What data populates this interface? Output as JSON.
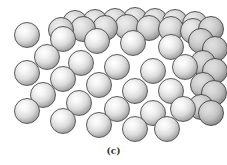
{
  "figure": {
    "caption": "(c)",
    "sphere_diameter": 26,
    "colors": {
      "highlight": "#ffffff",
      "shadow": "#4a4a4a",
      "outline": "#5a5a5a",
      "background": "#ffffff"
    },
    "spheres": [
      {
        "x": 62,
        "y": 10,
        "layer": "back"
      },
      {
        "x": 82,
        "y": 9,
        "layer": "back"
      },
      {
        "x": 102,
        "y": 8,
        "layer": "back"
      },
      {
        "x": 122,
        "y": 7,
        "layer": "back"
      },
      {
        "x": 142,
        "y": 8,
        "layer": "back"
      },
      {
        "x": 162,
        "y": 9,
        "layer": "back"
      },
      {
        "x": 182,
        "y": 11,
        "layer": "back"
      },
      {
        "x": 48,
        "y": 17,
        "layer": "back"
      },
      {
        "x": 70,
        "y": 16,
        "layer": "back"
      },
      {
        "x": 92,
        "y": 15,
        "layer": "back"
      },
      {
        "x": 114,
        "y": 14,
        "layer": "back"
      },
      {
        "x": 136,
        "y": 15,
        "layer": "back"
      },
      {
        "x": 158,
        "y": 16,
        "layer": "back"
      },
      {
        "x": 180,
        "y": 18,
        "layer": "back"
      },
      {
        "x": 198,
        "y": 16,
        "layer": "side"
      },
      {
        "x": 202,
        "y": 36,
        "layer": "side"
      },
      {
        "x": 202,
        "y": 58,
        "layer": "side"
      },
      {
        "x": 201,
        "y": 80,
        "layer": "side"
      },
      {
        "x": 198,
        "y": 100,
        "layer": "side"
      },
      {
        "x": 188,
        "y": 28,
        "layer": "side"
      },
      {
        "x": 190,
        "y": 50,
        "layer": "side"
      },
      {
        "x": 190,
        "y": 72,
        "layer": "side"
      },
      {
        "x": 188,
        "y": 94,
        "layer": "side"
      },
      {
        "x": 14,
        "y": 22,
        "layer": "front"
      },
      {
        "x": 50,
        "y": 26,
        "layer": "front"
      },
      {
        "x": 84,
        "y": 28,
        "layer": "front"
      },
      {
        "x": 120,
        "y": 30,
        "layer": "front"
      },
      {
        "x": 158,
        "y": 34,
        "layer": "front"
      },
      {
        "x": 34,
        "y": 44,
        "layer": "front"
      },
      {
        "x": 68,
        "y": 50,
        "layer": "front"
      },
      {
        "x": 104,
        "y": 54,
        "layer": "front"
      },
      {
        "x": 140,
        "y": 58,
        "layer": "front"
      },
      {
        "x": 172,
        "y": 54,
        "layer": "front"
      },
      {
        "x": 14,
        "y": 60,
        "layer": "front"
      },
      {
        "x": 50,
        "y": 66,
        "layer": "front"
      },
      {
        "x": 86,
        "y": 72,
        "layer": "front"
      },
      {
        "x": 122,
        "y": 78,
        "layer": "front"
      },
      {
        "x": 158,
        "y": 78,
        "layer": "front"
      },
      {
        "x": 30,
        "y": 82,
        "layer": "front"
      },
      {
        "x": 66,
        "y": 90,
        "layer": "front"
      },
      {
        "x": 104,
        "y": 96,
        "layer": "front"
      },
      {
        "x": 140,
        "y": 100,
        "layer": "front"
      },
      {
        "x": 170,
        "y": 96,
        "layer": "front"
      },
      {
        "x": 14,
        "y": 98,
        "layer": "front"
      },
      {
        "x": 50,
        "y": 108,
        "layer": "front"
      },
      {
        "x": 86,
        "y": 112,
        "layer": "front"
      },
      {
        "x": 122,
        "y": 116,
        "layer": "front"
      },
      {
        "x": 154,
        "y": 116,
        "layer": "front"
      }
    ]
  }
}
